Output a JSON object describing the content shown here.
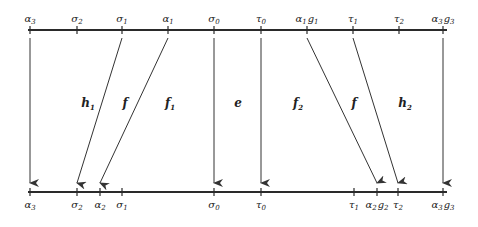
{
  "diagram": {
    "type": "line-mapping",
    "top_line": {
      "y": 30,
      "x_start": 28,
      "x_end": 447,
      "ticks": [
        {
          "id": "alpha3",
          "x": 30,
          "base": "α",
          "sub": "3",
          "extra": ""
        },
        {
          "id": "sigma2",
          "x": 77,
          "base": "σ",
          "sub": "2",
          "extra": ""
        },
        {
          "id": "sigma1",
          "x": 122,
          "base": "σ",
          "sub": "1",
          "extra": ""
        },
        {
          "id": "alpha1",
          "x": 168,
          "base": "α",
          "sub": "1",
          "extra": ""
        },
        {
          "id": "sigma0",
          "x": 214,
          "base": "σ",
          "sub": "0",
          "extra": ""
        },
        {
          "id": "tau0",
          "x": 261,
          "base": "τ",
          "sub": "0",
          "extra": ""
        },
        {
          "id": "alpha1g1",
          "x": 307,
          "base": "α",
          "sub": "1",
          "extra": "g",
          "extra_sub": "1"
        },
        {
          "id": "tau1",
          "x": 353,
          "base": "τ",
          "sub": "1",
          "extra": ""
        },
        {
          "id": "tau2",
          "x": 399,
          "base": "τ",
          "sub": "2",
          "extra": ""
        },
        {
          "id": "alpha3g3",
          "x": 443,
          "base": "α",
          "sub": "3",
          "extra": "g",
          "extra_sub": "3"
        }
      ]
    },
    "bottom_line": {
      "y": 192,
      "x_start": 28,
      "x_end": 447,
      "ticks": [
        {
          "id": "alpha3",
          "x": 30,
          "base": "α",
          "sub": "3",
          "extra": ""
        },
        {
          "id": "sigma2",
          "x": 77,
          "base": "σ",
          "sub": "2",
          "extra": ""
        },
        {
          "id": "alpha2",
          "x": 100,
          "base": "α",
          "sub": "2",
          "extra": ""
        },
        {
          "id": "sigma1",
          "x": 122,
          "base": "σ",
          "sub": "1",
          "extra": ""
        },
        {
          "id": "sigma0",
          "x": 214,
          "base": "σ",
          "sub": "0",
          "extra": ""
        },
        {
          "id": "tau0",
          "x": 261,
          "base": "τ",
          "sub": "0",
          "extra": ""
        },
        {
          "id": "tau1",
          "x": 354,
          "base": "τ",
          "sub": "1",
          "extra": ""
        },
        {
          "id": "alpha2g2",
          "x": 377,
          "base": "α",
          "sub": "2",
          "extra": "g",
          "extra_sub": "2"
        },
        {
          "id": "tau2",
          "x": 398,
          "base": "τ",
          "sub": "2",
          "extra": ""
        },
        {
          "id": "alpha3g3",
          "x": 443,
          "base": "α",
          "sub": "3",
          "extra": "g",
          "extra_sub": "3"
        }
      ]
    },
    "arrows": [
      {
        "from": "alpha3",
        "to": "alpha3",
        "x1": 30,
        "x2": 30
      },
      {
        "from": "sigma1",
        "to": "sigma2",
        "x1": 122,
        "x2": 77
      },
      {
        "from": "alpha1",
        "to": "alpha2",
        "x1": 168,
        "x2": 100
      },
      {
        "from": "sigma0",
        "to": "sigma0",
        "x1": 214,
        "x2": 214
      },
      {
        "from": "tau0",
        "to": "tau0",
        "x1": 261,
        "x2": 261
      },
      {
        "from": "alpha1g1",
        "to": "alpha2g2",
        "x1": 307,
        "x2": 377
      },
      {
        "from": "tau1",
        "to": "tau2",
        "x1": 353,
        "x2": 398
      },
      {
        "from": "alpha3g3",
        "to": "alpha3g3",
        "x1": 443,
        "x2": 443
      }
    ],
    "region_labels": [
      {
        "text": "h",
        "sub": "1",
        "x": 88,
        "y": 107
      },
      {
        "text": "f",
        "sub": "",
        "x": 125,
        "y": 107
      },
      {
        "text": "f",
        "sub": "1",
        "x": 170,
        "y": 107
      },
      {
        "text": "e",
        "sub": "",
        "x": 238,
        "y": 107
      },
      {
        "text": "f",
        "sub": "2",
        "x": 298,
        "y": 107
      },
      {
        "text": "f",
        "sub": "",
        "x": 354,
        "y": 107
      },
      {
        "text": "h",
        "sub": "2",
        "x": 405,
        "y": 107
      }
    ],
    "colors": {
      "line": "#2a2a2a",
      "arrow": "#333333",
      "text": "#222222",
      "background": "#ffffff"
    }
  }
}
